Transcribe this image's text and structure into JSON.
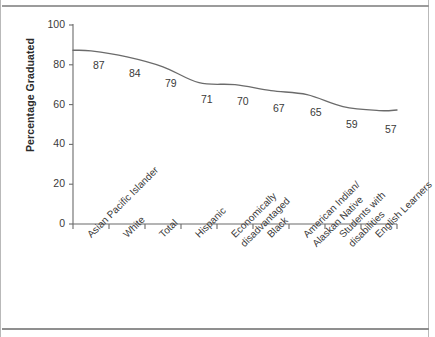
{
  "chart_data": {
    "type": "line",
    "title": "",
    "xlabel": "",
    "ylabel": "Percentage Graduated",
    "ylim": [
      0,
      100
    ],
    "yticks": [
      0,
      20,
      40,
      60,
      80,
      100
    ],
    "grid": false,
    "legend": "none",
    "categories": [
      "Asian Pacific Islander",
      "White",
      "Total",
      "Hispanic",
      "Economically disadvantaged",
      "Black",
      "American Indian/ Alaskan Native",
      "Students with disabilities",
      "English Learners"
    ],
    "category_lines": [
      [
        "Asian Pacific Islander"
      ],
      [
        "White"
      ],
      [
        "Total"
      ],
      [
        "Hispanic"
      ],
      [
        "Economically",
        "disadvantaged"
      ],
      [
        "Black"
      ],
      [
        "American Indian/",
        "Alaskan Native"
      ],
      [
        "Students with",
        "disabilities"
      ],
      [
        "English Learners"
      ]
    ],
    "values": [
      87,
      84,
      79,
      71,
      70,
      67,
      65,
      59,
      57
    ],
    "value_labels": [
      "87",
      "84",
      "79",
      "71",
      "70",
      "67",
      "65",
      "59",
      "57"
    ],
    "series": [
      {
        "name": "Percentage Graduated",
        "values": [
          87,
          84,
          79,
          71,
          70,
          67,
          65,
          59,
          57
        ]
      }
    ],
    "line_color": "#6b6b6b",
    "axis_color": "#6b6b6b",
    "text_color": "#3a3a3a",
    "background": "#ffffff"
  },
  "axis": {
    "y_tick_labels": [
      "100",
      "80",
      "60",
      "40",
      "20",
      "0"
    ],
    "title": "Percentage Graduated"
  }
}
